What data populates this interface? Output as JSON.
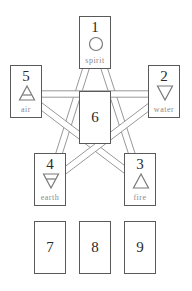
{
  "diagram": {
    "title": "",
    "colors": {
      "line": "#8c8c8c",
      "border": "#5a5a5a",
      "symbol": "#7a7a7a",
      "label": "#8a8a8a"
    },
    "star_connections": [
      [
        "1",
        "4"
      ],
      [
        "1",
        "3"
      ],
      [
        "5",
        "2"
      ],
      [
        "5",
        "3"
      ],
      [
        "2",
        "4"
      ]
    ],
    "cards": [
      {
        "id": "1",
        "number": "1",
        "element": "spirit",
        "symbol": "circle-icon"
      },
      {
        "id": "2",
        "number": "2",
        "element": "water",
        "symbol": "triangle-down-icon"
      },
      {
        "id": "3",
        "number": "3",
        "element": "fire",
        "symbol": "triangle-up-icon"
      },
      {
        "id": "4",
        "number": "4",
        "element": "earth",
        "symbol": "triangle-down-barred-icon"
      },
      {
        "id": "5",
        "number": "5",
        "element": "air",
        "symbol": "triangle-up-barred-icon"
      },
      {
        "id": "6",
        "number": "6",
        "element": "",
        "symbol": ""
      },
      {
        "id": "7",
        "number": "7",
        "element": "",
        "symbol": ""
      },
      {
        "id": "8",
        "number": "8",
        "element": "",
        "symbol": ""
      },
      {
        "id": "9",
        "number": "9",
        "element": "",
        "symbol": ""
      }
    ]
  }
}
